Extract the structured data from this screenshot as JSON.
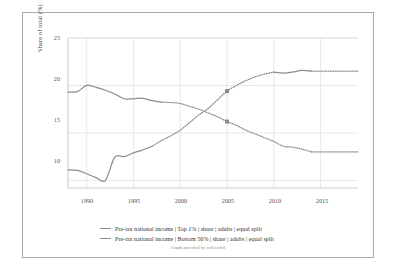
{
  "chart_data": {
    "type": "line",
    "title": "",
    "xlabel": "",
    "ylabel": "Share of total (%)",
    "xlim": [
      1988,
      2019
    ],
    "ylim": [
      9.2,
      25
    ],
    "grid": true,
    "legend_position": "bottom",
    "xticks": [
      "1990",
      "1995",
      "2000",
      "2005",
      "2010",
      "2015"
    ],
    "xtick_values": [
      1990,
      1995,
      2000,
      2005,
      2010,
      2015
    ],
    "yticks": [
      "10",
      "15",
      "20",
      "25"
    ],
    "ytick_values": [
      10,
      15,
      20,
      25
    ],
    "series": [
      {
        "name": "Pre-tax national income | Top 1% | share | adults | equal split",
        "color": "#8c8c8c",
        "marker_year": 2005,
        "marker_value": 16.2,
        "solid_x": [
          1988,
          1989,
          1990,
          1991,
          1992,
          1993,
          1994,
          1995,
          1996,
          1997,
          1998
        ],
        "solid_y": [
          19.3,
          19.35,
          20.0,
          19.8,
          19.5,
          19.1,
          18.6,
          18.6,
          18.65,
          18.4,
          18.25
        ],
        "dotted_x": [
          1998,
          1999,
          2000,
          2001,
          2002,
          2003,
          2004,
          2005,
          2006,
          2007,
          2008,
          2009,
          2010,
          2011,
          2012,
          2013,
          2014
        ],
        "dotted_y": [
          18.25,
          18.2,
          18.1,
          17.8,
          17.5,
          17.1,
          16.7,
          16.2,
          15.8,
          15.3,
          14.9,
          14.5,
          14.1,
          13.6,
          13.5,
          13.3,
          13.0
        ],
        "tail_x": [
          2014,
          2019
        ],
        "tail_y": [
          13.0,
          13.0
        ]
      },
      {
        "name": "Pre-tax national income | Bottom 50% | share | adults | equal split",
        "color": "#8c8c8c",
        "marker_year": 2005,
        "marker_value": 19.4,
        "solid_x": [
          1988,
          1989,
          1990,
          1991,
          1992,
          1993,
          1994,
          1995,
          1996,
          1997
        ],
        "solid_y": [
          11.1,
          11.05,
          10.7,
          10.3,
          10.0,
          12.45,
          12.5,
          12.9,
          13.2,
          13.6
        ],
        "dotted_x": [
          1997,
          1998,
          1999,
          2000,
          2001,
          2002,
          2003,
          2004,
          2005,
          2006,
          2007,
          2008,
          2009,
          2010
        ],
        "dotted_y": [
          13.6,
          14.2,
          14.7,
          15.3,
          16.1,
          16.9,
          17.6,
          18.5,
          19.4,
          20.0,
          20.5,
          20.9,
          21.2,
          21.4
        ],
        "solid2_x": [
          2010,
          2011,
          2012,
          2013,
          2014
        ],
        "solid2_y": [
          21.4,
          21.3,
          21.4,
          21.6,
          21.5
        ],
        "tail_x": [
          2014,
          2019
        ],
        "tail_y": [
          21.5,
          21.5
        ]
      }
    ],
    "annotations": {
      "credit": "Graph provided by wid.world"
    }
  },
  "legend": {
    "items": [
      {
        "label": "Pre-tax national income | Top 1% | share | adults | equal split"
      },
      {
        "label": "Pre-tax national income | Bottom 50% | share | adults | equal split"
      }
    ]
  },
  "axes": {
    "y_title": "Share of total (%)",
    "y_tick_labels": [
      "25",
      "20",
      "15",
      "10"
    ],
    "x_tick_labels": [
      "1990",
      "1995",
      "2000",
      "2005",
      "2010",
      "2015"
    ]
  },
  "credit": "Graph provided by wid.world",
  "colors": {
    "line": "#8c8c8c",
    "grid": "#d8d8d8",
    "frame": "#a8a8a8",
    "text": "#444444"
  }
}
